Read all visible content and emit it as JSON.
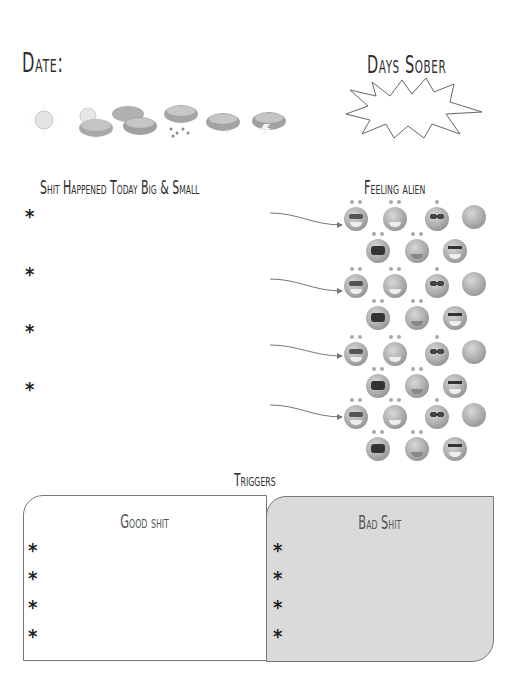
{
  "header": {
    "date_label": "Date:",
    "days_sober_label": "Days Sober"
  },
  "weather_icons": [
    "sun-icon",
    "sun-behind-cloud-icon",
    "clouds-icon",
    "rain-cloud-icon",
    "snow-cloud-icon",
    "storm-cloud-icon"
  ],
  "events": {
    "title": "Shit Happened Today Big & Small",
    "bullet": "*",
    "items": [
      "",
      "",
      "",
      ""
    ]
  },
  "feelings": {
    "title": "Feeling alien",
    "emotions": [
      "cool",
      "laughing",
      "worried",
      "sad",
      "crying",
      "upset",
      "angry"
    ]
  },
  "triggers": {
    "title": "Triggers",
    "good": {
      "title": "Good shit",
      "items": [
        "*",
        "*",
        "*",
        "*"
      ]
    },
    "bad": {
      "title": "Bad Shit",
      "items": [
        "*",
        "*",
        "*",
        "*"
      ]
    }
  },
  "colors": {
    "bad_box_fill": "#dadada",
    "text": "#2e2e2e",
    "border": "#777777"
  }
}
